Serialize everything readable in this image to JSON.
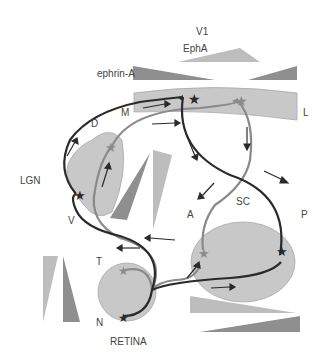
{
  "labels": {
    "v1": "V1",
    "epha": "EphA",
    "ephrin_a": "ephrin-A",
    "m": "M",
    "l": "L",
    "d": "D",
    "v": "V",
    "lgn": "LGN",
    "sc": "SC",
    "a": "A",
    "p": "P",
    "t": "T",
    "n": "N",
    "retina": "RETINA"
  },
  "colors": {
    "region_fill": "#c8c8c8",
    "region_stroke": "#a8a8a8",
    "dark_axon": "#2a2a2a",
    "light_axon": "#8a8a8a",
    "light_gradient": "#bdbdbd",
    "dark_gradient": "#8f8f8f"
  },
  "regions": [
    "V1",
    "LGN",
    "SC",
    "RETINA"
  ]
}
